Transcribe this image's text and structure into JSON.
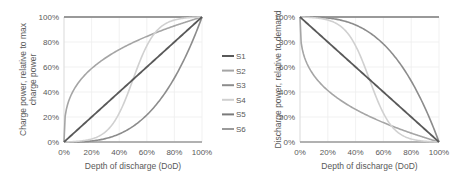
{
  "chart_data": [
    {
      "type": "line",
      "title": "",
      "xlabel": "Depth of discharge (DoD)",
      "ylabel": "Charge power, relative to max charge power",
      "ylabel_lines": [
        "Charge power, relative to max",
        "charge power"
      ],
      "xlim": [
        0,
        100
      ],
      "ylim": [
        0,
        100
      ],
      "x_ticks": [
        "0%",
        "20%",
        "40%",
        "60%",
        "80%",
        "100%"
      ],
      "y_ticks": [
        "0%",
        "20%",
        "40%",
        "60%",
        "80%",
        "100%"
      ],
      "grid": true,
      "x": [
        0,
        10,
        20,
        30,
        40,
        50,
        60,
        70,
        80,
        90,
        100
      ],
      "series": [
        {
          "name": "S1",
          "color": "#595959",
          "values": [
            0,
            10,
            20,
            30,
            40,
            50,
            60,
            70,
            80,
            90,
            100
          ]
        },
        {
          "name": "S2",
          "color": "#a5a5a5",
          "values": [
            0,
            46,
            58,
            67,
            74,
            79,
            84,
            89,
            93,
            96,
            100
          ]
        },
        {
          "name": "S3",
          "color": "#8c8c8c",
          "values": [
            0,
            0.1,
            0.8,
            2.7,
            6.4,
            12.5,
            21.6,
            34.3,
            51.2,
            72.9,
            100
          ]
        },
        {
          "name": "S4",
          "color": "#d0d0d0",
          "values": [
            0,
            1,
            3,
            9,
            26,
            50,
            74,
            91,
            97,
            99,
            100
          ]
        },
        {
          "name": "S5",
          "color": "#7a7a7a",
          "values": [
            100,
            100,
            100,
            100,
            100,
            100,
            100,
            100,
            100,
            100,
            100
          ]
        },
        {
          "name": "S6",
          "color": "#9a9a9a",
          "values": [
            0,
            0,
            0,
            0,
            0,
            0,
            0,
            0,
            0,
            0,
            0
          ]
        }
      ]
    },
    {
      "type": "line",
      "title": "",
      "xlabel": "Depth of discharge (DoD)",
      "ylabel": "Discharge power, relative to demand",
      "xlim": [
        0,
        100
      ],
      "ylim": [
        0,
        100
      ],
      "x_ticks": [
        "0%",
        "20%",
        "40%",
        "60%",
        "80%",
        "100%"
      ],
      "y_ticks": [
        "0%",
        "20%",
        "40%",
        "60%",
        "80%",
        "100%"
      ],
      "grid": true,
      "x": [
        0,
        10,
        20,
        30,
        40,
        50,
        60,
        70,
        80,
        90,
        100
      ],
      "series": [
        {
          "name": "S1",
          "color": "#595959",
          "values": [
            100,
            90,
            80,
            70,
            60,
            50,
            40,
            30,
            20,
            10,
            0
          ]
        },
        {
          "name": "S2",
          "color": "#a5a5a5",
          "values": [
            100,
            54,
            42,
            33,
            26,
            21,
            16,
            11,
            7,
            4,
            0
          ]
        },
        {
          "name": "S3",
          "color": "#8c8c8c",
          "values": [
            100,
            99.9,
            99.2,
            97.3,
            93.6,
            87.5,
            78.4,
            65.7,
            48.8,
            27.1,
            0
          ]
        },
        {
          "name": "S4",
          "color": "#d0d0d0",
          "values": [
            100,
            99,
            97,
            91,
            74,
            50,
            26,
            9,
            3,
            1,
            0
          ]
        },
        {
          "name": "S5",
          "color": "#7a7a7a",
          "values": [
            100,
            100,
            100,
            100,
            100,
            100,
            100,
            100,
            100,
            100,
            100
          ]
        },
        {
          "name": "S6",
          "color": "#9a9a9a",
          "values": [
            0,
            0,
            0,
            0,
            0,
            0,
            0,
            0,
            0,
            0,
            0
          ]
        }
      ]
    }
  ],
  "legend": {
    "position": "center-between-plots",
    "entries": [
      "S1",
      "S2",
      "S3",
      "S4",
      "S5",
      "S6"
    ]
  }
}
